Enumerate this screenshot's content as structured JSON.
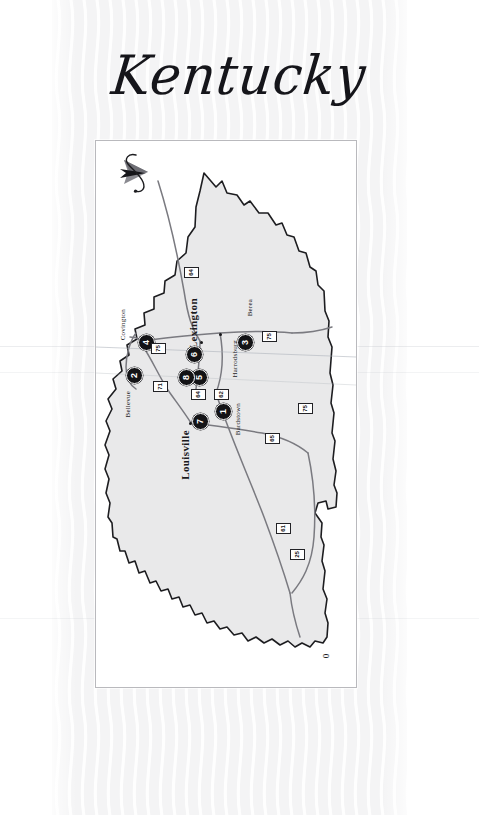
{
  "page": {
    "title": "Kentucky",
    "background_color": "#f4f4f5",
    "paper_color": "#ffffff"
  },
  "map": {
    "panel_border_color": "#b9b9bd",
    "state_fill_color": "#e9e9ea",
    "state_outline_color": "#1d1d20",
    "road_color": "#7a7a80",
    "marker_color": "#131316",
    "marker_text_color": "#ffffff",
    "compass_icon": "north-arrow-icon",
    "scale_label": "0",
    "cities": [
      {
        "name": "Covington",
        "class": "city-minor",
        "left": 23,
        "top": 168
      },
      {
        "name": "Bellevue",
        "class": "city-minor",
        "left": 28,
        "top": 250
      },
      {
        "name": "Lexington",
        "class": "city-major",
        "left": 91,
        "top": 157
      },
      {
        "name": "Louisville",
        "class": "city-major",
        "left": 83,
        "top": 289
      },
      {
        "name": "Berea",
        "class": "city-minor",
        "left": 150,
        "top": 158
      },
      {
        "name": "Harrodsburg",
        "class": "city-minor",
        "left": 135,
        "top": 199
      },
      {
        "name": "Bardstown",
        "class": "city-minor",
        "left": 138,
        "top": 262
      }
    ],
    "markers": [
      {
        "number": "1",
        "left": 119,
        "top": 262
      },
      {
        "number": "2",
        "left": 30,
        "top": 226
      },
      {
        "number": "3",
        "left": 141,
        "top": 193
      },
      {
        "number": "4",
        "left": 42,
        "top": 193
      },
      {
        "number": "5",
        "left": 95,
        "top": 228
      },
      {
        "number": "6",
        "left": 90,
        "top": 205
      },
      {
        "number": "7",
        "left": 96,
        "top": 272
      },
      {
        "number": "8",
        "left": 82,
        "top": 228
      }
    ],
    "shields": [
      {
        "route": "64",
        "left": 88,
        "top": 126
      },
      {
        "route": "75",
        "left": 55,
        "top": 202
      },
      {
        "route": "75",
        "left": 166,
        "top": 190
      },
      {
        "route": "71",
        "left": 57,
        "top": 240
      },
      {
        "route": "64",
        "left": 95,
        "top": 248
      },
      {
        "route": "62",
        "left": 118,
        "top": 248
      },
      {
        "route": "65",
        "left": 169,
        "top": 292
      },
      {
        "route": "61",
        "left": 180,
        "top": 382
      },
      {
        "route": "75",
        "left": 202,
        "top": 262
      },
      {
        "route": "25",
        "left": 194,
        "top": 408
      }
    ],
    "city_dots": [
      {
        "left": 123,
        "top": 192
      },
      {
        "left": 104,
        "top": 200
      },
      {
        "left": 93,
        "top": 281
      },
      {
        "left": 45,
        "top": 201
      }
    ]
  }
}
